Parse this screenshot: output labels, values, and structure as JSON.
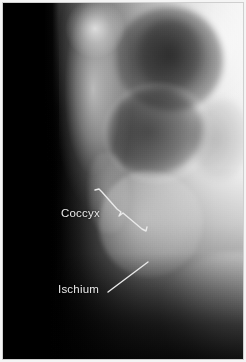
{
  "figure": {
    "kind": "radiograph",
    "modality": "X-ray",
    "view": "lateral pelvis",
    "width": 246,
    "height": 362
  },
  "annotations": [
    {
      "id": "coccyx",
      "label": "Coccyx",
      "leader_style": "bracket",
      "label_x": 61,
      "label_y": 207,
      "leader_points": "92,187 96,186 99,189 114,206 118,209 116,213 120,210 139,226 143,228 144,224",
      "color": "#e9e9e9"
    },
    {
      "id": "ischium",
      "label": "Ischium",
      "leader_style": "straight",
      "label_x": 58,
      "label_y": 283,
      "leader_points": "105,289 145,259",
      "color": "#e9e9e9"
    }
  ],
  "palette": {
    "film_black": "#000000",
    "soft_tissue_mid": "#989898",
    "bone_bright": "#f0f0f0",
    "border": "#f4f4f4",
    "border_rule": "#cfcfcf",
    "annotation": "#e9e9e9"
  }
}
